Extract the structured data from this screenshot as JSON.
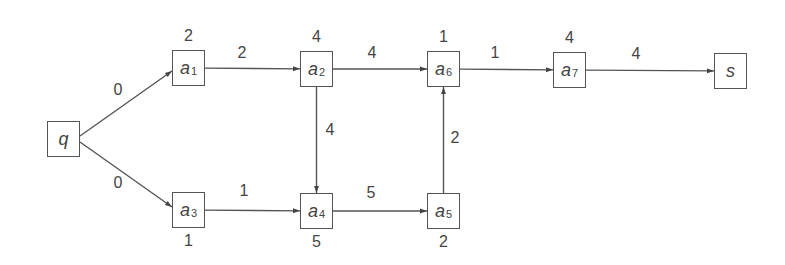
{
  "diagram": {
    "type": "activity-on-node network",
    "nodes": [
      {
        "id": "q",
        "name": "q",
        "sub": "",
        "weight": "",
        "x": 47,
        "y": 121,
        "weight_pos": "none"
      },
      {
        "id": "a1",
        "name": "a",
        "sub": "1",
        "weight": "2",
        "x": 172,
        "y": 50,
        "weight_pos": "above"
      },
      {
        "id": "a2",
        "name": "a",
        "sub": "2",
        "weight": "4",
        "x": 300,
        "y": 51,
        "weight_pos": "above"
      },
      {
        "id": "a3",
        "name": "a",
        "sub": "3",
        "weight": "1",
        "x": 172,
        "y": 192,
        "weight_pos": "below"
      },
      {
        "id": "a4",
        "name": "a",
        "sub": "4",
        "weight": "5",
        "x": 300,
        "y": 193,
        "weight_pos": "below"
      },
      {
        "id": "a5",
        "name": "a",
        "sub": "5",
        "weight": "2",
        "x": 427,
        "y": 193,
        "weight_pos": "below"
      },
      {
        "id": "a6",
        "name": "a",
        "sub": "6",
        "weight": "1",
        "x": 427,
        "y": 51,
        "weight_pos": "above"
      },
      {
        "id": "a7",
        "name": "a",
        "sub": "7",
        "weight": "4",
        "x": 553,
        "y": 52,
        "weight_pos": "above"
      },
      {
        "id": "s",
        "name": "s",
        "sub": "",
        "weight": "",
        "x": 714,
        "y": 53,
        "weight_pos": "none"
      }
    ],
    "edges": [
      {
        "from": "q",
        "to": "a1",
        "label": "0",
        "lx": 118,
        "ly": 90
      },
      {
        "from": "q",
        "to": "a3",
        "label": "0",
        "lx": 118,
        "ly": 183
      },
      {
        "from": "a1",
        "to": "a2",
        "label": "2",
        "lx": 242,
        "ly": 53
      },
      {
        "from": "a2",
        "to": "a6",
        "label": "4",
        "lx": 372,
        "ly": 53
      },
      {
        "from": "a6",
        "to": "a7",
        "label": "1",
        "lx": 495,
        "ly": 53
      },
      {
        "from": "a7",
        "to": "s",
        "label": "4",
        "lx": 636,
        "ly": 54
      },
      {
        "from": "a2",
        "to": "a4",
        "label": "4",
        "lx": 330,
        "ly": 130
      },
      {
        "from": "a3",
        "to": "a4",
        "label": "1",
        "lx": 244,
        "ly": 191
      },
      {
        "from": "a4",
        "to": "a5",
        "label": "5",
        "lx": 371,
        "ly": 193
      },
      {
        "from": "a5",
        "to": "a6",
        "label": "2",
        "lx": 455,
        "ly": 138
      }
    ],
    "colors": {
      "stroke": "#555555",
      "text": "#444444",
      "background": "#ffffff"
    }
  }
}
